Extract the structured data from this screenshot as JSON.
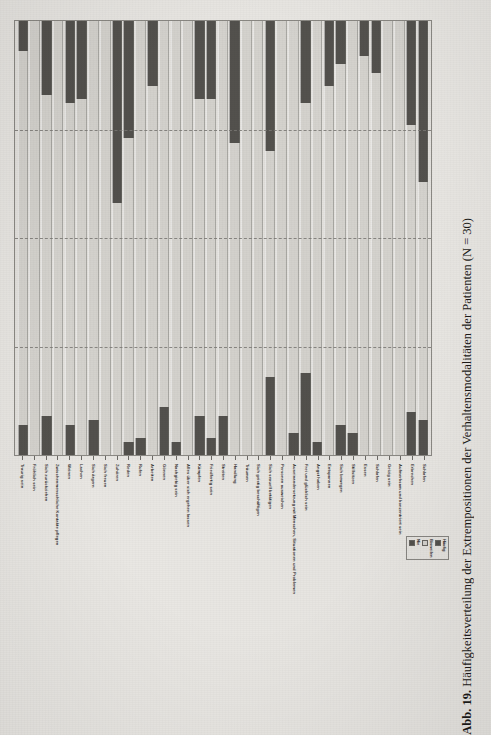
{
  "figure": {
    "caption_number": "Abb. 19.",
    "caption_text": "Häufigkeitsverteilung der Extrempositionen der Verhaltensmodalitäten der Patienten (N = 30)"
  },
  "legend": {
    "items": [
      {
        "label": "Nie",
        "color": "#55534f"
      },
      {
        "label": "Bisweilen",
        "color": "#d8d6d1"
      },
      {
        "label": "Häufig",
        "color": "#55534f"
      }
    ]
  },
  "chart_data": {
    "type": "bar",
    "title": "Häufigkeitsverteilung der Extrempositionen der Verhaltensmodalitäten der Patienten (N = 30)",
    "xlabel": "",
    "ylabel": "",
    "ylim": [
      0,
      100
    ],
    "stacked": true,
    "percent": true,
    "grid": true,
    "gridlines": [
      25,
      50,
      75
    ],
    "legend_position": "bottom-right",
    "orientation": "vertical-rotated",
    "categories": [
      "Traurig sein",
      "Fröhlich sein",
      "Sich zurückziehen",
      "Zwischenmenschliche Kontakte pflegen",
      "Weinen",
      "Lachen",
      "Sich ärgern",
      "Sich freuen",
      "Zuhören",
      "Reden",
      "Rufen",
      "Arbeiten",
      "Gönnen",
      "Nachgiebig sein",
      "Alles über sich ergehen lassen",
      "Kämpfen",
      "Friedfertig sein",
      "Streiten",
      "Handlung",
      "Träumen",
      "Sich geistig beschäftigen",
      "Sich sexuell betätigen",
      "Personen ausweichen",
      "Auseinandersetzung mit Menschen, Situationen und Problemen",
      "Frei und glücklich sein",
      "Angst haben",
      "Entspannen",
      "Sich bewegen",
      "Stillsitzen",
      "Essen",
      "Schlafen",
      "Geizig sein",
      "Aufmerksam und konzentriert sein",
      "Erbrechen",
      "Schlafen"
    ],
    "series": [
      {
        "name": "Nie",
        "color": "#55534f",
        "values": [
          7,
          0,
          9,
          0,
          7,
          0,
          8,
          0,
          0,
          3,
          4,
          0,
          11,
          3,
          0,
          9,
          4,
          9,
          0,
          0,
          0,
          18,
          0,
          5,
          19,
          3,
          0,
          7,
          5,
          0,
          0,
          0,
          0,
          10,
          8
        ]
      },
      {
        "name": "Bisweilen",
        "color": "#d8d6d1",
        "values": [
          86,
          100,
          74,
          100,
          74,
          82,
          92,
          100,
          58,
          70,
          96,
          85,
          89,
          97,
          100,
          73,
          78,
          91,
          72,
          100,
          100,
          52,
          100,
          95,
          62,
          97,
          85,
          83,
          95,
          92,
          88,
          100,
          100,
          66,
          55
        ]
      },
      {
        "name": "Häufig",
        "color": "#55534f",
        "values": [
          7,
          0,
          17,
          0,
          19,
          18,
          0,
          0,
          42,
          27,
          0,
          15,
          0,
          0,
          0,
          18,
          18,
          0,
          28,
          0,
          0,
          30,
          0,
          0,
          19,
          0,
          15,
          10,
          0,
          8,
          12,
          0,
          0,
          24,
          37
        ]
      }
    ],
    "bars": [
      {
        "label": "Traurig sein",
        "haeufig": 7,
        "bisweilen": 86,
        "nie": 7
      },
      {
        "label": "Fröhlich sein",
        "haeufig": 0,
        "bisweilen": 100,
        "nie": 0
      },
      {
        "label": "Sich zurückziehen",
        "haeufig": 17,
        "bisweilen": 74,
        "nie": 9
      },
      {
        "label": "Zwischenmenschliche Kontakte pflegen",
        "haeufig": 0,
        "bisweilen": 100,
        "nie": 0
      },
      {
        "label": "Weinen",
        "haeufig": 19,
        "bisweilen": 74,
        "nie": 7
      },
      {
        "label": "Lachen",
        "haeufig": 18,
        "bisweilen": 82,
        "nie": 0
      },
      {
        "label": "Sich ärgern",
        "haeufig": 0,
        "bisweilen": 92,
        "nie": 8
      },
      {
        "label": "Sich freuen",
        "haeufig": 0,
        "bisweilen": 100,
        "nie": 0
      },
      {
        "label": "Zuhören",
        "haeufig": 42,
        "bisweilen": 58,
        "nie": 0
      },
      {
        "label": "Reden",
        "haeufig": 27,
        "bisweilen": 70,
        "nie": 3
      },
      {
        "label": "Rufen",
        "haeufig": 0,
        "bisweilen": 96,
        "nie": 4
      },
      {
        "label": "Arbeiten",
        "haeufig": 15,
        "bisweilen": 85,
        "nie": 0
      },
      {
        "label": "Gönnen",
        "haeufig": 0,
        "bisweilen": 89,
        "nie": 11
      },
      {
        "label": "Nachgiebig sein",
        "haeufig": 0,
        "bisweilen": 97,
        "nie": 3
      },
      {
        "label": "Alles über sich ergehen lassen",
        "haeufig": 0,
        "bisweilen": 100,
        "nie": 0
      },
      {
        "label": "Kämpfen",
        "haeufig": 18,
        "bisweilen": 73,
        "nie": 9
      },
      {
        "label": "Friedfertig sein",
        "haeufig": 18,
        "bisweilen": 78,
        "nie": 4
      },
      {
        "label": "Streiten",
        "haeufig": 0,
        "bisweilen": 91,
        "nie": 9
      },
      {
        "label": "Handlung",
        "haeufig": 28,
        "bisweilen": 72,
        "nie": 0
      },
      {
        "label": "Träumen",
        "haeufig": 0,
        "bisweilen": 100,
        "nie": 0
      },
      {
        "label": "Sich geistig beschäftigen",
        "haeufig": 0,
        "bisweilen": 100,
        "nie": 0
      },
      {
        "label": "Sich sexuell betätigen",
        "haeufig": 30,
        "bisweilen": 52,
        "nie": 18
      },
      {
        "label": "Personen ausweichen",
        "haeufig": 0,
        "bisweilen": 100,
        "nie": 0
      },
      {
        "label": "Auseinandersetzung mit Menschen, Situationen und Problemen",
        "haeufig": 0,
        "bisweilen": 95,
        "nie": 5
      },
      {
        "label": "Frei und glücklich sein",
        "haeufig": 19,
        "bisweilen": 62,
        "nie": 19
      },
      {
        "label": "Angst haben",
        "haeufig": 0,
        "bisweilen": 97,
        "nie": 3
      },
      {
        "label": "Entspannen",
        "haeufig": 15,
        "bisweilen": 85,
        "nie": 0
      },
      {
        "label": "Sich bewegen",
        "haeufig": 10,
        "bisweilen": 83,
        "nie": 7
      },
      {
        "label": "Stillsitzen",
        "haeufig": 0,
        "bisweilen": 95,
        "nie": 5
      },
      {
        "label": "Essen",
        "haeufig": 8,
        "bisweilen": 92,
        "nie": 0
      },
      {
        "label": "Schlafen",
        "haeufig": 12,
        "bisweilen": 88,
        "nie": 0
      },
      {
        "label": "Geizig sein",
        "haeufig": 0,
        "bisweilen": 100,
        "nie": 0
      },
      {
        "label": "Aufmerksam und konzentriert sein",
        "haeufig": 0,
        "bisweilen": 100,
        "nie": 0
      },
      {
        "label": "Erbrechen",
        "haeufig": 24,
        "bisweilen": 66,
        "nie": 10
      },
      {
        "label": "Schlafen",
        "haeufig": 37,
        "bisweilen": 55,
        "nie": 8
      }
    ]
  }
}
